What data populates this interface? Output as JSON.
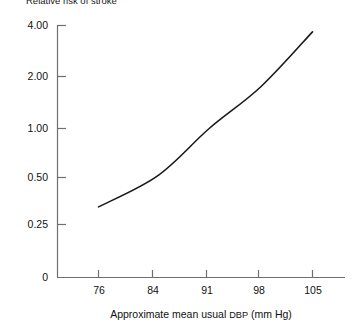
{
  "chart_data": {
    "type": "line",
    "title": "Relative risk of stroke",
    "xlabel": "Approximate mean usual DBP (mm Hg)",
    "ylabel": "",
    "x": [
      76,
      84,
      91,
      98,
      105
    ],
    "values": [
      0.35,
      0.53,
      1.0,
      1.75,
      3.65
    ],
    "series": [
      {
        "name": "Relative risk of stroke",
        "values": [
          0.35,
          0.53,
          1.0,
          1.75,
          3.65
        ]
      }
    ],
    "categories": [
      "76",
      "84",
      "91",
      "98",
      "105"
    ],
    "yscale": "log",
    "ylim": [
      0.25,
      4.0
    ],
    "xlim": [
      76,
      105
    ],
    "grid": false,
    "legend": false,
    "y_ticks": [
      {
        "value": 4.0,
        "label": "4.00"
      },
      {
        "value": 2.0,
        "label": "2.00"
      },
      {
        "value": 1.0,
        "label": "1.00"
      },
      {
        "value": 0.5,
        "label": "0.50"
      },
      {
        "value": 0.25,
        "label": "0.25"
      },
      {
        "value": 0,
        "label": "0"
      }
    ],
    "x_ticks": [
      {
        "value": 76,
        "label": "76"
      },
      {
        "value": 84,
        "label": "84"
      },
      {
        "value": 91,
        "label": "91"
      },
      {
        "value": 98,
        "label": "98"
      },
      {
        "value": 105,
        "label": "105"
      }
    ],
    "line_color": "#1a1a1a",
    "axis_color": "#6e6e6e"
  },
  "axis_title_parts": {
    "before": "Approximate mean usual ",
    "acronym": "DBP",
    "after": " (mm Hg)"
  }
}
